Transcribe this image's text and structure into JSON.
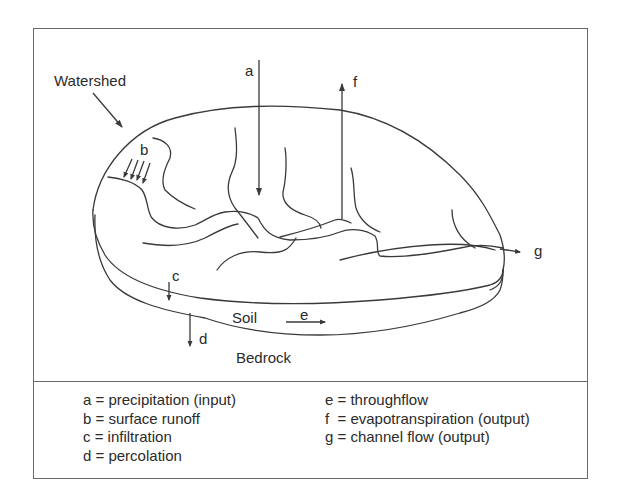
{
  "diagram": {
    "type": "watershed hydrologic cycle",
    "labels": {
      "watershed": "Watershed",
      "a": "a",
      "b": "b",
      "c": "c",
      "d": "d",
      "e": "e",
      "f": "f",
      "g": "g",
      "soil": "Soil",
      "bedrock": "Bedrock"
    },
    "line_color": "#3a3a3a",
    "frame_color": "#6a6a6a"
  },
  "legend": {
    "left": [
      {
        "key": "a",
        "text": "a = precipitation (input)"
      },
      {
        "key": "b",
        "text": "b = surface runoff"
      },
      {
        "key": "c",
        "text": "c = infiltration"
      },
      {
        "key": "d",
        "text": "d = percolation"
      }
    ],
    "right": [
      {
        "key": "e",
        "text": "e = throughflow"
      },
      {
        "key": "f",
        "text": "f  = evapotranspiration (output)"
      },
      {
        "key": "g",
        "text": "g = channel flow (output)"
      }
    ]
  }
}
